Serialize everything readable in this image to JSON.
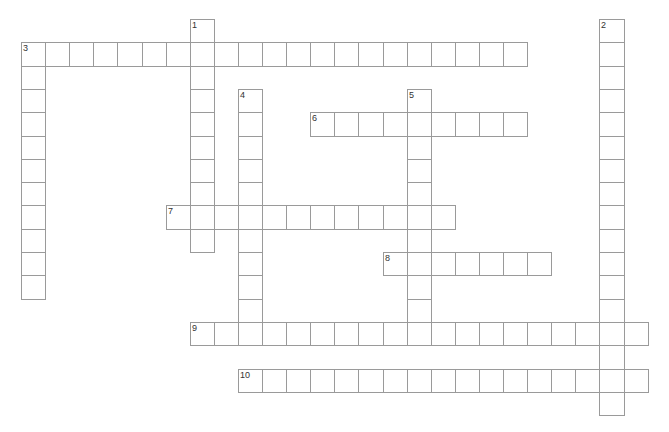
{
  "puzzle": {
    "type": "crossword",
    "grid": {
      "origin_x": 21,
      "origin_y": 19,
      "cell_w": 24.1,
      "cell_h": 23.3,
      "border_color": "#9a9a9a",
      "number_color": "#333333"
    },
    "words": [
      {
        "number": "1",
        "direction": "down",
        "row": 0,
        "col": 7,
        "length": 10
      },
      {
        "number": "2",
        "direction": "down",
        "row": 0,
        "col": 24,
        "length": 17
      },
      {
        "number": "3",
        "direction": "across",
        "row": 1,
        "col": 0,
        "length": 21
      },
      {
        "number": "3",
        "direction": "down",
        "row": 1,
        "col": 0,
        "length": 11
      },
      {
        "number": "4",
        "direction": "down",
        "row": 3,
        "col": 9,
        "length": 10
      },
      {
        "number": "5",
        "direction": "down",
        "row": 3,
        "col": 16,
        "length": 11
      },
      {
        "number": "6",
        "direction": "across",
        "row": 4,
        "col": 12,
        "length": 9
      },
      {
        "number": "7",
        "direction": "across",
        "row": 8,
        "col": 6,
        "length": 12
      },
      {
        "number": "8",
        "direction": "across",
        "row": 10,
        "col": 15,
        "length": 7
      },
      {
        "number": "9",
        "direction": "across",
        "row": 13,
        "col": 7,
        "length": 19
      },
      {
        "number": "10",
        "direction": "across",
        "row": 15,
        "col": 9,
        "length": 17
      }
    ]
  }
}
